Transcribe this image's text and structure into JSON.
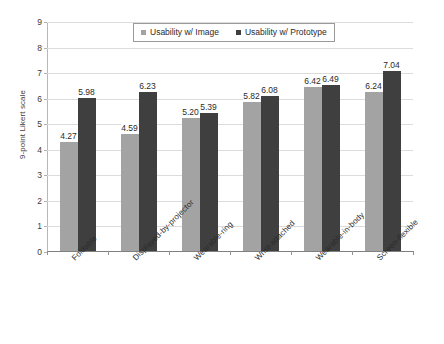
{
  "chart_data": {
    "type": "bar",
    "title": "",
    "subtitle": "",
    "xlabel": "",
    "ylabel": "9-point Likert scale",
    "ylim": [
      0,
      9
    ],
    "yticks": [
      0,
      1,
      2,
      3,
      4,
      5,
      6,
      7,
      8,
      9
    ],
    "grid": true,
    "legend_position": "top-center",
    "categories": [
      "Foldable",
      "Displayed-by-projector",
      "Wearable-ring",
      "Wrist-attached",
      "Wearable-in-body",
      "Screen-flexible"
    ],
    "series": [
      {
        "name": "Usability w/ Image",
        "color": "#a3a3a3",
        "values": [
          4.27,
          4.59,
          5.2,
          5.82,
          6.42,
          6.24
        ],
        "labels": [
          "4.27",
          "4.59",
          "5.20",
          "5.82",
          "6.42",
          "6.24"
        ]
      },
      {
        "name": "Usability w/ Prototype",
        "color": "#3f3f3f",
        "values": [
          5.98,
          6.23,
          5.39,
          6.08,
          6.49,
          7.04
        ],
        "labels": [
          "5.98",
          "6.23",
          "5.39",
          "6.08",
          "6.49",
          "7.04"
        ]
      }
    ]
  },
  "axes": {
    "y_title": "9-point Likert scale",
    "y_tick_labels": [
      "0",
      "1",
      "2",
      "3",
      "4",
      "5",
      "6",
      "7",
      "8",
      "9"
    ]
  },
  "legend": {
    "entries": [
      {
        "label": "Usability w/ Image",
        "swatch": "light-gray-square-icon"
      },
      {
        "label": "Usability w/ Prototype",
        "swatch": "dark-gray-square-icon"
      }
    ]
  },
  "colors": {
    "series_light": "#a3a3a3",
    "series_dark": "#3f3f3f",
    "gridline": "#dcdcdc",
    "axis": "#909090",
    "background": "#ffffff"
  }
}
